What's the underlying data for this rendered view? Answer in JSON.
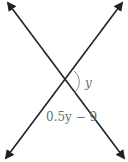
{
  "diagram": {
    "type": "intersecting-lines",
    "lines": [
      {
        "name": "line-1",
        "from": [
          8,
          3
        ],
        "to": [
          124,
          158
        ],
        "arrows": "both"
      },
      {
        "name": "line-2",
        "from": [
          122,
          3
        ],
        "to": [
          6,
          158
        ],
        "arrows": "both"
      }
    ],
    "intersection": [
      66,
      82
    ],
    "angles": [
      {
        "label": "y",
        "position": "right",
        "marked": true
      },
      {
        "label": "0.5y − 9",
        "position": "bottom",
        "marked": false
      }
    ],
    "colors": {
      "line": "#222222",
      "label": "#6e6e6e",
      "arc": "#8a8a8a"
    }
  },
  "labels": {
    "angle_right": "y",
    "angle_bottom": "0.5y − 9"
  }
}
